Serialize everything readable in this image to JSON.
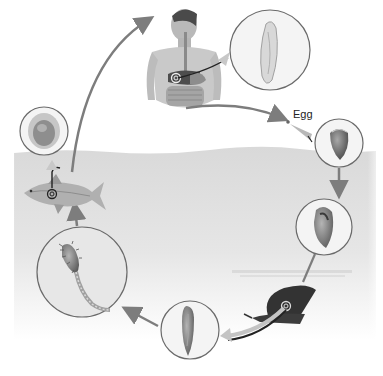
{
  "diagram": {
    "type": "life-cycle",
    "labels": {
      "egg": "Egg"
    },
    "colors": {
      "water": "#dcdcdc",
      "water_fade": "#f4f4f4",
      "arrow": "#7d7d7d",
      "circle_stroke": "#6a6a6a",
      "circle_fill": "#f1f1f1",
      "organism_dark": "#3a3a3a",
      "organism_mid": "#8c8c8c",
      "skin": "#c9c9c9"
    },
    "stages": [
      {
        "id": "human-host",
        "description": "human torso with liver marked"
      },
      {
        "id": "adult-fluke",
        "description": "magnified elongated adult worm"
      },
      {
        "id": "egg",
        "description": "egg passed in feces"
      },
      {
        "id": "miracidium-egg",
        "description": "operculated egg in water"
      },
      {
        "id": "sporocyst",
        "description": "larva inside snail stage"
      },
      {
        "id": "snail-host",
        "description": "snail first intermediate host"
      },
      {
        "id": "redia",
        "description": "elongated larval stage"
      },
      {
        "id": "cercaria",
        "description": "tailed free-swimming larva"
      },
      {
        "id": "fish-host",
        "description": "fish second intermediate host"
      },
      {
        "id": "metacercaria",
        "description": "encysted larva"
      }
    ]
  }
}
